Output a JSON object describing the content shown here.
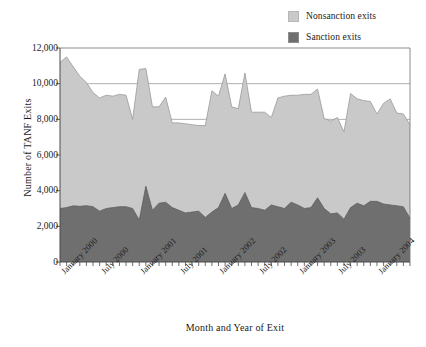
{
  "legend": {
    "position": "top-right",
    "items": [
      {
        "label": "Nonsanction exits",
        "color": "#c9c9c9",
        "key": "nonsanction"
      },
      {
        "label": "Sanction exits",
        "color": "#6f6f6f",
        "key": "sanction"
      }
    ]
  },
  "axes": {
    "ylabel": "Number of TANF Exits",
    "xlabel": "Month and Year of Exit",
    "yticks": [
      "0",
      "2,000",
      "4,000",
      "6,000",
      "8,000",
      "10,000",
      "12,000"
    ],
    "xticks": [
      "January 2000",
      "July 2000",
      "January 2001",
      "July 2001",
      "January 2002",
      "July 2002",
      "January 2003",
      "July 2003",
      "January 2004"
    ]
  },
  "chart_data": {
    "type": "area",
    "stacked": true,
    "title": "",
    "xlabel": "Month and Year of Exit",
    "ylabel": "Number of TANF Exits",
    "ylim": [
      0,
      12000
    ],
    "ytick_step": 2000,
    "grid": "horizontal-gridlines-at-8000-and-10000",
    "legend_position": "top-right",
    "x_tick_labels": [
      "January 2000",
      "July 2000",
      "January 2001",
      "July 2001",
      "January 2002",
      "July 2002",
      "January 2003",
      "July 2003",
      "January 2004"
    ],
    "x_tick_indices": [
      0,
      6,
      12,
      18,
      24,
      30,
      36,
      42,
      48
    ],
    "x": [
      "Jan 2000",
      "Feb 2000",
      "Mar 2000",
      "Apr 2000",
      "May 2000",
      "Jun 2000",
      "Jul 2000",
      "Aug 2000",
      "Sep 2000",
      "Oct 2000",
      "Nov 2000",
      "Dec 2000",
      "Jan 2001",
      "Feb 2001",
      "Mar 2001",
      "Apr 2001",
      "May 2001",
      "Jun 2001",
      "Jul 2001",
      "Aug 2001",
      "Sep 2001",
      "Oct 2001",
      "Nov 2001",
      "Dec 2001",
      "Jan 2002",
      "Feb 2002",
      "Mar 2002",
      "Apr 2002",
      "May 2002",
      "Jun 2002",
      "Jul 2002",
      "Aug 2002",
      "Sep 2002",
      "Oct 2002",
      "Nov 2002",
      "Dec 2002",
      "Jan 2003",
      "Feb 2003",
      "Mar 2003",
      "Apr 2003",
      "May 2003",
      "Jun 2003",
      "Jul 2003",
      "Aug 2003",
      "Sep 2003",
      "Oct 2003",
      "Nov 2003",
      "Dec 2003",
      "Jan 2004",
      "Feb 2004",
      "Mar 2004",
      "Apr 2004",
      "May 2004",
      "Jun 2004"
    ],
    "series": [
      {
        "name": "Sanction exits",
        "color": "#6f6f6f",
        "values": [
          3000,
          3050,
          3150,
          3120,
          3160,
          3100,
          2850,
          3000,
          3050,
          3100,
          3100,
          3000,
          2350,
          4250,
          2900,
          3300,
          3350,
          3050,
          2900,
          2750,
          2800,
          2850,
          2500,
          2800,
          3050,
          3850,
          3000,
          3200,
          3900,
          3050,
          3000,
          2900,
          3200,
          3100,
          3000,
          3350,
          3200,
          3000,
          3050,
          3600,
          3000,
          2700,
          2750,
          2400,
          3050,
          3300,
          3150,
          3400,
          3400,
          3250,
          3200,
          3150,
          3100,
          2450
        ]
      },
      {
        "name": "Nonsanction exits",
        "color": "#c9c9c9",
        "values": [
          8200,
          8450,
          7800,
          7300,
          6900,
          6400,
          6350,
          6350,
          6250,
          6300,
          6250,
          5000,
          8450,
          6600,
          5800,
          5400,
          5900,
          4750,
          4900,
          5000,
          4900,
          4800,
          5150,
          6800,
          6250,
          6700,
          5700,
          5400,
          6700,
          5350,
          5400,
          5500,
          4900,
          6100,
          6300,
          6000,
          6150,
          6400,
          6350,
          6100,
          5050,
          5200,
          5350,
          4900,
          6400,
          5850,
          5900,
          5600,
          4900,
          5650,
          5950,
          5200,
          5200,
          5250
        ]
      }
    ]
  }
}
